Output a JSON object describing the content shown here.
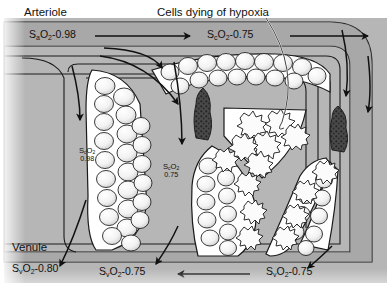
{
  "figure": {
    "domain": "diagram",
    "annotation_title": "Cells dying of hypoxia",
    "vessel_labels": {
      "arteriole": "Arteriole",
      "venule": "Venule"
    }
  },
  "saturations": {
    "arterial_inflow": {
      "symbol_s": "S",
      "symbol_sub": "a",
      "symbol_o2": "O",
      "symbol_o2_sub": "2",
      "value": "-0.98",
      "full": "SaO2-0.98"
    },
    "capillary_top": {
      "symbol_s": "S",
      "symbol_sub": "c",
      "symbol_o2": "O",
      "symbol_o2_sub": "2",
      "value": "-0.75",
      "full": "ScO2-0.75"
    },
    "capillary_left": {
      "symbol_s": "S",
      "symbol_sub": "c",
      "symbol_o2": "O",
      "symbol_o2_sub": "2",
      "value": "0.98",
      "full": "ScO2 0.98"
    },
    "capillary_mid": {
      "symbol_s": "S",
      "symbol_sub": "c",
      "symbol_o2": "O",
      "symbol_o2_sub": "2",
      "value": "0.75",
      "full": "ScO2 0.75"
    },
    "venous_left": {
      "symbol_s": "S",
      "symbol_sub": "v",
      "symbol_o2": "O",
      "symbol_o2_sub": "2",
      "value": "-0.80",
      "full": "SvO2-0.80"
    },
    "venous_mid": {
      "symbol_s": "S",
      "symbol_sub": "v",
      "symbol_o2": "O",
      "symbol_o2_sub": "2",
      "value": "-0.75",
      "full": "SvO2-0.75"
    },
    "venous_right": {
      "symbol_s": "S",
      "symbol_sub": "v",
      "symbol_o2": "O",
      "symbol_o2_sub": "2",
      "value": "-0.75",
      "full": "SvO2-0.75"
    }
  },
  "features": {
    "occlusions": 2,
    "occlusion_name": "capillary-occlusion",
    "healthy_cell_style": "smooth-rounded",
    "dying_cell_style": "jagged-spiculated"
  },
  "colors": {
    "vessel_fill": "#a8a8a8",
    "tissue_fill": "#b4b4b4",
    "lumen_white": "#ffffff",
    "outline": "#1a1a1a",
    "occlusion": "#3a3a3a",
    "cell_light": "#ffffff",
    "cell_shade": "#c9c9c9",
    "text": "#111111"
  }
}
